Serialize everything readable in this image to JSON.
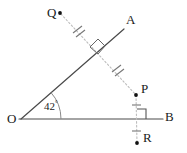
{
  "figure": {
    "background_color": "#ffffff",
    "solid_line_color": "#4a4a4a",
    "dashed_line_color": "#b4b4b4",
    "point_color": "#111111",
    "label_color": "#1a1a1a",
    "mark_color": "#555555"
  },
  "labels": {
    "Q": "Q",
    "A": "A",
    "P": "P",
    "B": "B",
    "R": "R",
    "O": "O",
    "angle": "42",
    "degree_symbol": "°"
  },
  "points": {
    "O": {
      "name": "O",
      "x": 21,
      "y": 119
    },
    "A": {
      "name": "A",
      "x": 124,
      "y": 29
    },
    "B": {
      "name": "B",
      "x": 163,
      "y": 119
    },
    "Q": {
      "name": "Q",
      "x": 60,
      "y": 13
    },
    "P": {
      "name": "P",
      "x": 136,
      "y": 95
    },
    "R": {
      "name": "R",
      "x": 137,
      "y": 143
    },
    "intersection_QP_OA": {
      "name": "M",
      "x": 98,
      "y": 47
    },
    "intersection_PR_OB": {
      "name": "N",
      "x": 137,
      "y": 119
    }
  },
  "segments": [
    {
      "name": "ray-OA",
      "from": "O",
      "to": "A",
      "style": "solid"
    },
    {
      "name": "ray-OB",
      "from": "O",
      "to": "B",
      "style": "solid"
    },
    {
      "name": "segment-QP",
      "from": "Q",
      "to": "P",
      "style": "dashed"
    },
    {
      "name": "segment-PR",
      "from": "P",
      "to": "R",
      "style": "dashed"
    }
  ],
  "marks": [
    {
      "name": "right-angle-at-OA",
      "type": "right-angle",
      "at": "intersection_QP_OA"
    },
    {
      "name": "right-angle-at-OB",
      "type": "right-angle",
      "at": "intersection_PR_OB"
    },
    {
      "name": "tick-QM",
      "type": "double-tick",
      "on": "segment-QP",
      "position": "upper"
    },
    {
      "name": "tick-MP",
      "type": "double-tick",
      "on": "segment-QP",
      "position": "lower"
    },
    {
      "name": "tick-PN",
      "type": "single-tick",
      "on": "segment-PR",
      "position": "upper"
    },
    {
      "name": "tick-NR",
      "type": "single-tick",
      "on": "segment-PR",
      "position": "lower"
    }
  ],
  "angles": [
    {
      "name": "angle-AOB",
      "vertex": "O",
      "value": 42,
      "unit": "degrees"
    }
  ]
}
